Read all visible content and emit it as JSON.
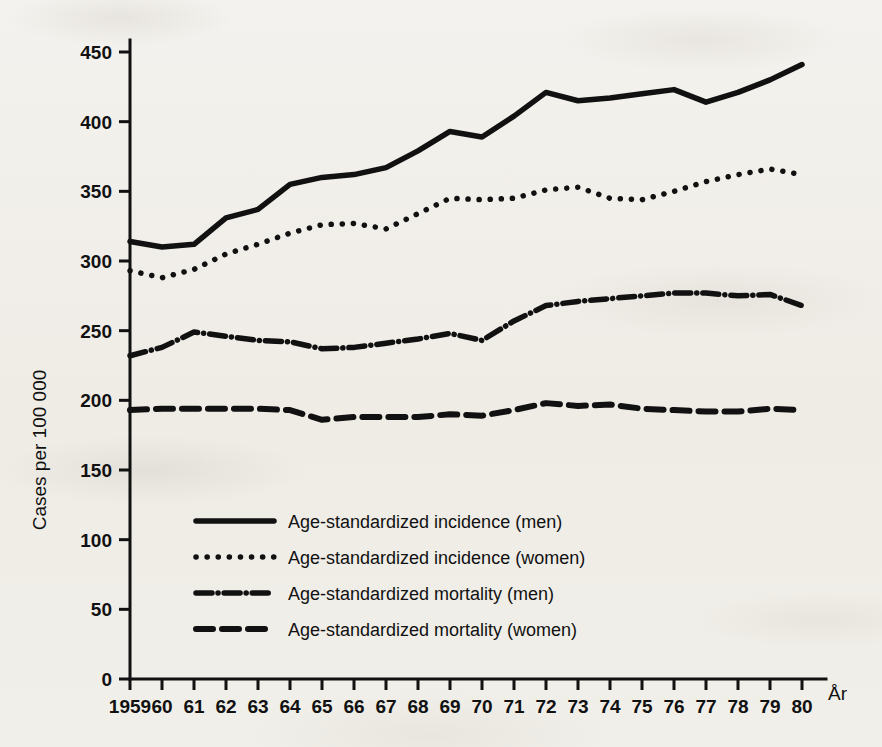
{
  "chart_data": {
    "type": "line",
    "title": "",
    "xlabel": "År",
    "ylabel": "Cases per 100 000",
    "xlim": [
      1959,
      1980
    ],
    "ylim": [
      0,
      450
    ],
    "ytick_step": 50,
    "yticks": [
      0,
      50,
      100,
      150,
      200,
      250,
      300,
      350,
      400,
      450
    ],
    "ytick_labels": [
      "0",
      "50",
      "100",
      "150",
      "200",
      "250",
      "300",
      "350",
      "400",
      "450"
    ],
    "x": [
      1959,
      1960,
      1961,
      1962,
      1963,
      1964,
      1965,
      1966,
      1967,
      1968,
      1969,
      1970,
      1971,
      1972,
      1973,
      1974,
      1975,
      1976,
      1977,
      1978,
      1979,
      1980
    ],
    "xtick_labels": [
      "1959",
      "60",
      "61",
      "62",
      "63",
      "64",
      "65",
      "66",
      "67",
      "68",
      "69",
      "70",
      "71",
      "72",
      "73",
      "74",
      "75",
      "76",
      "77",
      "78",
      "79",
      "80"
    ],
    "grid": false,
    "legend_position": "lower-center",
    "series": [
      {
        "name": "Age-standardized incidence (men)",
        "style": "solid",
        "color": "#111111",
        "values": [
          314,
          310,
          312,
          331,
          337,
          355,
          360,
          362,
          367,
          379,
          393,
          389,
          404,
          421,
          415,
          417,
          420,
          423,
          414,
          421,
          430,
          441
        ]
      },
      {
        "name": "Age-standardized incidence (women)",
        "style": "dotted",
        "color": "#111111",
        "values": [
          293,
          288,
          294,
          305,
          312,
          320,
          326,
          327,
          323,
          334,
          345,
          344,
          345,
          351,
          353,
          345,
          344,
          350,
          357,
          362,
          366,
          362
        ]
      },
      {
        "name": "Age-standardized mortality (men)",
        "style": "dash-dot",
        "color": "#111111",
        "values": [
          232,
          238,
          249,
          246,
          243,
          242,
          237,
          238,
          241,
          244,
          248,
          243,
          257,
          268,
          271,
          273,
          275,
          277,
          277,
          275,
          276,
          268
        ]
      },
      {
        "name": "Age-standardized mortality (women)",
        "style": "dashed",
        "color": "#111111",
        "values": [
          193,
          194,
          194,
          194,
          194,
          193,
          186,
          188,
          188,
          188,
          190,
          189,
          193,
          198,
          196,
          197,
          194,
          193,
          192,
          192,
          194,
          193
        ]
      }
    ]
  },
  "legend": {
    "items": [
      {
        "label": "Age-standardized incidence (men)",
        "style": "solid"
      },
      {
        "label": "Age-standardized incidence (women)",
        "style": "dotted"
      },
      {
        "label": "Age-standardized mortality (men)",
        "style": "dash-dot"
      },
      {
        "label": "Age-standardized mortality (women)",
        "style": "dashed"
      }
    ]
  }
}
